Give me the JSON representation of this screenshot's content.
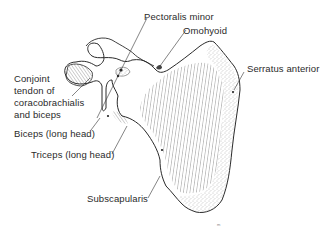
{
  "figure": {
    "labels": {
      "pectoralis_minor": "Pectoralis minor",
      "omohyoid": "Omohyoid",
      "serratus_anterior": "Serratus anterior",
      "conjoint_tendon_line1": "Conjoint",
      "conjoint_tendon_line2": "tendon of",
      "conjoint_tendon_line3": "coracobrachialis",
      "conjoint_tendon_line4": "and biceps",
      "biceps_long_head": "Biceps (long head)",
      "triceps_long_head": "Triceps (long head)",
      "subscapularis": "Subscapularis"
    },
    "colors": {
      "outline": "#2a2a2a",
      "hatching": "#555555",
      "stipple": "#888888",
      "background": "#ffffff"
    }
  }
}
